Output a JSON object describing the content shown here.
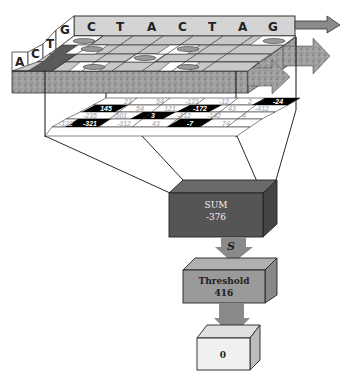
{
  "diagram": {
    "type": "position-weight-matrix scoring illustration",
    "sequence": {
      "letters": [
        "C",
        "T",
        "A",
        "C",
        "T",
        "A",
        "G"
      ]
    },
    "alphabet": {
      "letters": [
        "A",
        "C",
        "T",
        "G"
      ]
    },
    "weight_matrix": {
      "rows": [
        [
          "23",
          "54",
          "-121",
          "-12",
          "2",
          "-24"
        ],
        [
          "145",
          "54",
          "121",
          "-172",
          "43",
          "-412"
        ],
        [
          "-235",
          "-501",
          "3",
          "-312",
          "-142",
          "4"
        ],
        [
          "-122",
          "-321",
          "-312",
          "43",
          "-7",
          "74"
        ]
      ],
      "highlighted": [
        "145",
        "-24",
        "-172",
        "3",
        "-321",
        "-7"
      ]
    },
    "sum_box": {
      "label": "SUM",
      "value": "-376"
    },
    "arrow_label": "S",
    "threshold_box": {
      "label": "Threshold",
      "value": "416"
    },
    "output_box": {
      "value": "0"
    },
    "colors": {
      "sequence_bar": "#d4d4d4",
      "arrow": "#8a8a8a",
      "sum_box": "#555555",
      "threshold_box": "#9a9a9a",
      "output_box": "#f0f0f0",
      "highlight_cell": "#000000"
    }
  }
}
